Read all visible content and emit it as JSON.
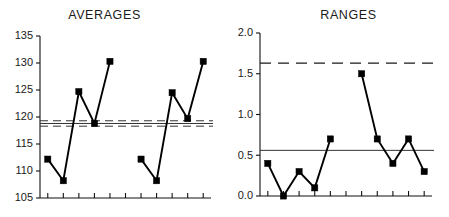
{
  "figure": {
    "panels": [
      {
        "key": "averages",
        "title": "AVERAGES"
      },
      {
        "key": "ranges",
        "title": "RANGES"
      }
    ]
  },
  "averages": {
    "title": "AVERAGES",
    "y_ticks": [
      "135",
      "130",
      "125",
      "120",
      "115",
      "110",
      "105"
    ]
  },
  "ranges": {
    "title": "RANGES",
    "y_ticks": [
      "2.0",
      "1.5",
      "1.0",
      "0.5",
      "0.0"
    ]
  },
  "chart_data": [
    {
      "type": "line",
      "title": "AVERAGES",
      "xlabel": "",
      "ylabel": "",
      "ylim": [
        105,
        135
      ],
      "yticks": [
        105,
        110,
        115,
        120,
        125,
        130,
        135
      ],
      "ytick_labels": [
        "105",
        "110",
        "115",
        "120",
        "125",
        "130",
        "135"
      ],
      "grid": false,
      "legend": "none",
      "x_axis": {
        "n_ticks": 11,
        "tick_labels": [],
        "xlim": [
          0.5,
          11.5
        ]
      },
      "series": [
        {
          "name": "subgroup average",
          "marker": "filled-square",
          "color": "#000000",
          "x": [
            1,
            2,
            3,
            4,
            5
          ],
          "values": [
            112.2,
            108.2,
            124.7,
            118.8,
            130.3
          ]
        },
        {
          "name": "subgroup average (second run)",
          "marker": "filled-square",
          "color": "#000000",
          "x": [
            7,
            8,
            9,
            10,
            11
          ],
          "values": [
            112.2,
            108.2,
            124.5,
            119.7,
            130.3
          ]
        }
      ],
      "reference_lines": [
        {
          "name": "upper control limit",
          "value": 119.3,
          "style": "dashed",
          "color": "#333333"
        },
        {
          "name": "center line",
          "value": 118.8,
          "style": "solid",
          "color": "#333333"
        },
        {
          "name": "lower control limit",
          "value": 118.3,
          "style": "dashed",
          "color": "#333333"
        }
      ]
    },
    {
      "type": "line",
      "title": "RANGES",
      "xlabel": "",
      "ylabel": "",
      "ylim": [
        0.0,
        2.0
      ],
      "yticks": [
        0.0,
        0.5,
        1.0,
        1.5,
        2.0
      ],
      "ytick_labels": [
        "0.0",
        "0.5",
        "1.0",
        "1.5",
        "2.0"
      ],
      "grid": false,
      "legend": "none",
      "x_axis": {
        "n_ticks": 11,
        "tick_labels": [],
        "xlim": [
          0.5,
          11.5
        ]
      },
      "series": [
        {
          "name": "subgroup range",
          "marker": "filled-square",
          "color": "#000000",
          "x": [
            1,
            2,
            3,
            4,
            5
          ],
          "values": [
            0.4,
            0.0,
            0.3,
            0.1,
            0.7
          ]
        },
        {
          "name": "subgroup range (second run)",
          "marker": "filled-square",
          "color": "#000000",
          "x": [
            7,
            8,
            9,
            10,
            11
          ],
          "values": [
            1.5,
            0.7,
            0.4,
            0.7,
            0.3
          ]
        }
      ],
      "reference_lines": [
        {
          "name": "upper control limit",
          "value": 1.63,
          "style": "dashed",
          "color": "#1a1a1a"
        },
        {
          "name": "center line",
          "value": 0.56,
          "style": "solid",
          "color": "#333333"
        }
      ]
    }
  ]
}
